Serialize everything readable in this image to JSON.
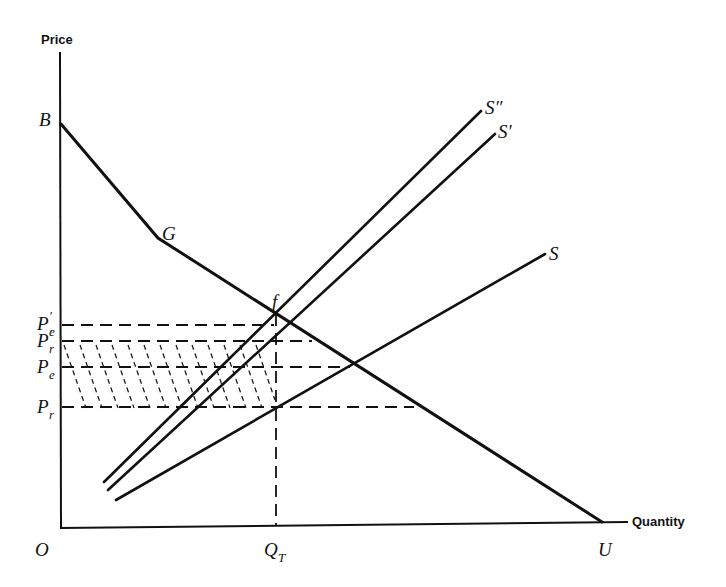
{
  "axes": {
    "y_label": "Price",
    "x_label": "Quantity",
    "origin_label": "O"
  },
  "points": {
    "B": "B",
    "G": "G",
    "f": "f",
    "U": "U"
  },
  "curves": {
    "demand": {
      "name": "Demand (kinked) B–G–U",
      "vertices": [
        "B",
        "G",
        "U"
      ]
    },
    "supply_s": {
      "label": "S"
    },
    "supply_s_prime": {
      "label": "S′"
    },
    "supply_s_double_prime": {
      "label": "S″"
    }
  },
  "price_levels": [
    {
      "id": "Pe_prime",
      "main": "P",
      "sub": "e",
      "prime": "′"
    },
    {
      "id": "Pr_prime",
      "main": "P",
      "sub": "r",
      "prime": "′"
    },
    {
      "id": "Pe",
      "main": "P",
      "sub": "e",
      "prime": ""
    },
    {
      "id": "Pr",
      "main": "P",
      "sub": "r",
      "prime": ""
    }
  ],
  "quantity_levels": [
    {
      "id": "QT",
      "main": "Q",
      "sub": "T"
    }
  ],
  "shaded_region": {
    "description": "Hatched rectangle between P′r and Pr from O to QT"
  }
}
